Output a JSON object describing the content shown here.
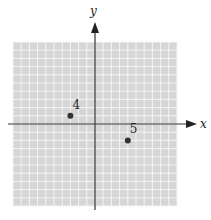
{
  "diagram": {
    "type": "coordinate-grid",
    "x_axis_label": "x",
    "y_axis_label": "y",
    "grid": {
      "xmin": -10,
      "xmax": 10,
      "ymin": -10,
      "ymax": 10,
      "cells": 20
    },
    "points": [
      {
        "label": "4",
        "x": -3,
        "y": 1
      },
      {
        "label": "5",
        "x": 4,
        "y": -2
      }
    ],
    "colors": {
      "grid_fill": "#d6d6d6",
      "grid_line": "#f4f4f4",
      "axis": "#333333",
      "point": "#333333"
    }
  }
}
